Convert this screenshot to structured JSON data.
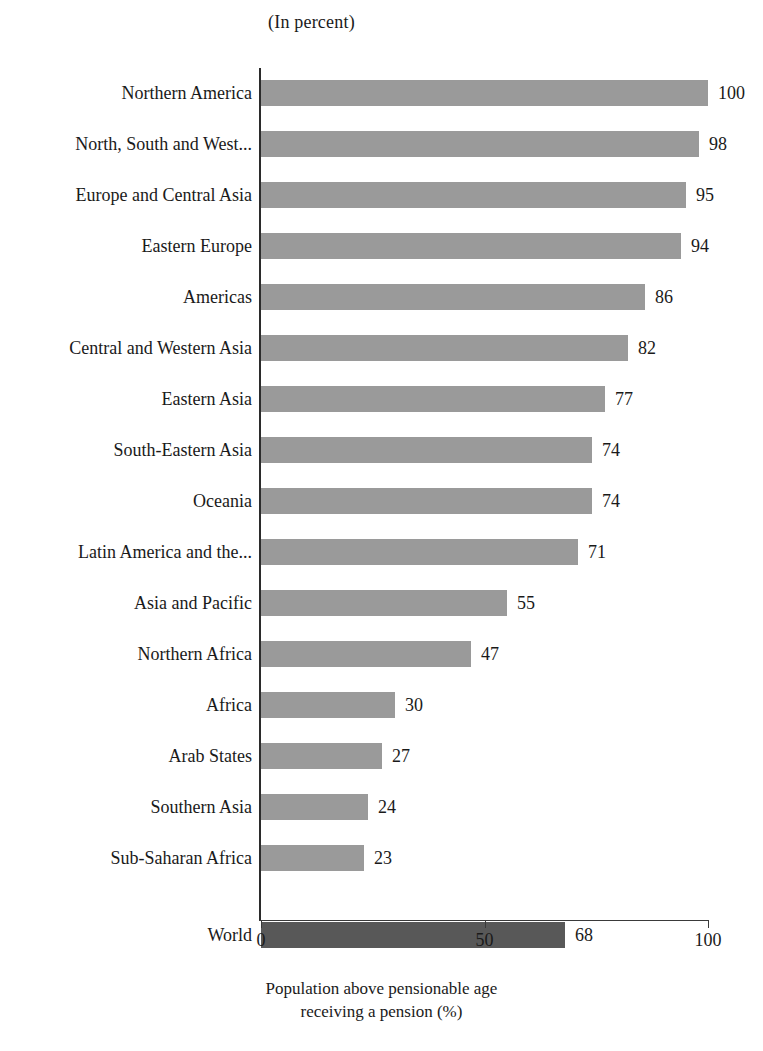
{
  "chart_data": {
    "type": "bar",
    "orientation": "horizontal",
    "title": "(In percent)",
    "xlabel": "Population above pensionable age receiving a pension (%)",
    "ylabel": "",
    "xlim": [
      0,
      100
    ],
    "xticks": [
      0,
      50,
      100
    ],
    "xtick_labels": [
      "0",
      "50",
      "100"
    ],
    "grid": false,
    "legend": null,
    "categories": [
      "Northern America",
      "North, South and West...",
      "Europe and Central Asia",
      "Eastern Europe",
      "Americas",
      "Central and Western Asia",
      "Eastern Asia",
      "South-Eastern Asia",
      "Oceania",
      "Latin America and the...",
      "Asia and Pacific",
      "Northern Africa",
      "Africa",
      "Arab States",
      "Southern Asia",
      "Sub-Saharan Africa",
      "World"
    ],
    "values": [
      100,
      98,
      95,
      94,
      86,
      82,
      77,
      74,
      74,
      71,
      55,
      47,
      30,
      27,
      24,
      23,
      68
    ],
    "value_labels": [
      "100",
      "98",
      "95",
      "94",
      "86",
      "82",
      "77",
      "74",
      "74",
      "71",
      "55",
      "47",
      "30",
      "27",
      "24",
      "23",
      "68"
    ],
    "highlight_category": "World",
    "colors": {
      "bar": "#9a9a9a",
      "bar_highlight": "#585858",
      "axis": "#2b2b2b",
      "text": "#1a1a1a",
      "background": "#ffffff"
    }
  },
  "caption": {
    "line1": "Population above pensionable age",
    "line2": "receiving a pension (%)"
  }
}
